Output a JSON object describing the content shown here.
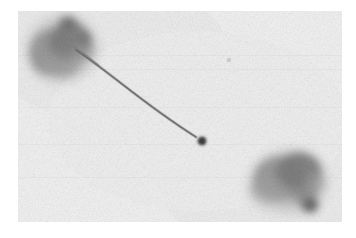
{
  "figure": {
    "kind": "grayscale-micrograph",
    "description": "Electron micrograph / autoradiograph of two dark stained bodies joined by a thin filament",
    "canvas": {
      "width": 356,
      "height": 238
    },
    "plate": {
      "x": 18,
      "y": 11,
      "width": 324,
      "height": 211
    },
    "background_color": "#f1f1f1",
    "page_color": "#ffffff",
    "ink_color": "#3c3c3c",
    "mid_tone_color": "#8a8a8a",
    "light_tone_color": "#c9c9c9",
    "grain": {
      "enabled": true,
      "amount": "fine",
      "tone": "#d9d9d9"
    },
    "objects": [
      {
        "name": "upper-left-body",
        "label": "upper left stained body",
        "center_x": 63,
        "center_y": 48,
        "radius_x": 32,
        "radius_y": 30,
        "darkness": 0.78,
        "lobes": [
          {
            "cx": 52,
            "cy": 52,
            "rx": 22,
            "ry": 22,
            "darkness": 0.72
          },
          {
            "cx": 70,
            "cy": 42,
            "rx": 21,
            "ry": 19,
            "darkness": 0.8
          },
          {
            "cx": 62,
            "cy": 62,
            "rx": 18,
            "ry": 15,
            "darkness": 0.62
          },
          {
            "cx": 82,
            "cy": 50,
            "rx": 12,
            "ry": 11,
            "darkness": 0.55
          },
          {
            "cx": 68,
            "cy": 24,
            "rx": 8,
            "ry": 6,
            "darkness": 0.85
          },
          {
            "cx": 84,
            "cy": 40,
            "rx": 6,
            "ry": 5,
            "darkness": 0.8
          }
        ]
      },
      {
        "name": "lower-right-body",
        "label": "lower right stained body",
        "center_x": 288,
        "center_y": 182,
        "radius_x": 34,
        "radius_y": 28,
        "darkness": 0.74,
        "lobes": [
          {
            "cx": 280,
            "cy": 178,
            "rx": 26,
            "ry": 21,
            "darkness": 0.7
          },
          {
            "cx": 299,
            "cy": 172,
            "rx": 22,
            "ry": 19,
            "darkness": 0.78
          },
          {
            "cx": 268,
            "cy": 188,
            "rx": 17,
            "ry": 14,
            "darkness": 0.55
          },
          {
            "cx": 305,
            "cy": 192,
            "rx": 12,
            "ry": 13,
            "darkness": 0.72
          },
          {
            "cx": 310,
            "cy": 205,
            "rx": 8,
            "ry": 7,
            "darkness": 0.88
          },
          {
            "cx": 316,
            "cy": 183,
            "rx": 8,
            "ry": 9,
            "darkness": 0.5
          }
        ]
      },
      {
        "name": "filament-tail",
        "label": "thin connecting filament",
        "path": "M 76,50 C 88,58 104,70 122,84 C 140,98 166,118 196,137",
        "stroke_width": 1.7,
        "darkness": 0.62
      },
      {
        "name": "terminal-dot",
        "label": "dark terminal dot at filament end",
        "center_x": 202,
        "center_y": 141,
        "radius": 4.2,
        "darkness": 0.92
      },
      {
        "name": "faint-speck",
        "label": "faint speck in background",
        "center_x": 229,
        "center_y": 60,
        "radius": 2.0,
        "darkness": 0.2
      }
    ]
  }
}
